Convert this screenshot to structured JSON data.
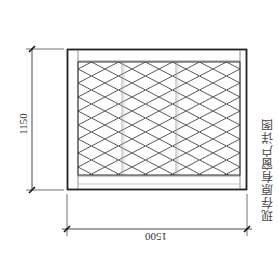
{
  "drawing": {
    "title": "现存原有窗户详图",
    "dimensions": {
      "height": "1150",
      "width": "1500"
    },
    "colors": {
      "frame": "#222222",
      "inner_line": "#777777",
      "mesh": "#444444",
      "dim_line": "#333333",
      "background": "#ffffff"
    },
    "elements": {
      "outer_frame": "window-outer-frame",
      "inner_frame": "window-inner-frame",
      "mesh_panel": "diamond-mesh-grille",
      "mullions": 2
    }
  }
}
